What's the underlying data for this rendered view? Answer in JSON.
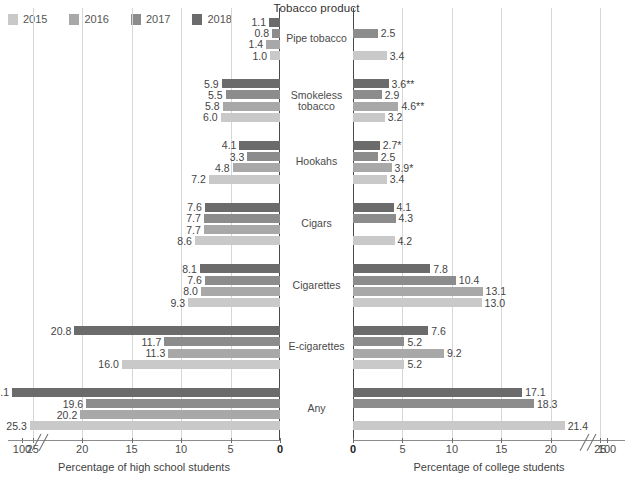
{
  "chart_title": "Tobacco product",
  "legend": {
    "items": [
      {
        "label": "2015",
        "color": "#c9c9c9"
      },
      {
        "label": "2016",
        "color": "#a8a8a8"
      },
      {
        "label": "2017",
        "color": "#8c8c8c"
      },
      {
        "label": "2018",
        "color": "#6b6b6b"
      }
    ]
  },
  "axes": {
    "left": {
      "caption": "Percentage of high school students",
      "ticks": [
        "100",
        "25",
        "20",
        "15",
        "10",
        "5",
        "0"
      ],
      "break_after": "100"
    },
    "right": {
      "caption": "Percentage of college students",
      "ticks": [
        "0",
        "5",
        "10",
        "15",
        "20",
        "25",
        "100"
      ],
      "break_before": "100"
    }
  },
  "chart_data": {
    "type": "bar",
    "orientation": "horizontal-pyramid",
    "title": "Tobacco product",
    "categories": [
      "Pipe tobacco",
      "Smokeless tobacco",
      "Hookahs",
      "Cigars",
      "Cigarettes",
      "E-cigarettes",
      "Any"
    ],
    "xlabel_left": "Percentage of high school students",
    "xlabel_right": "Percentage of college students",
    "xlim": [
      0,
      27.5
    ],
    "grid": true,
    "legend_position": "top-left",
    "series": [
      {
        "name": "2018",
        "color": "#6b6b6b"
      },
      {
        "name": "2017",
        "color": "#8c8c8c"
      },
      {
        "name": "2016",
        "color": "#a8a8a8"
      },
      {
        "name": "2015",
        "color": "#c9c9c9"
      }
    ],
    "panels": [
      {
        "name": "high school students",
        "side": "left",
        "groups": [
          {
            "category": "Pipe tobacco",
            "bars": [
              {
                "year": "2018",
                "value": 1.1,
                "label": "1.1"
              },
              {
                "year": "2017",
                "value": 0.8,
                "label": "0.8"
              },
              {
                "year": "2016",
                "value": 1.4,
                "label": "1.4"
              },
              {
                "year": "2015",
                "value": 1.0,
                "label": "1.0"
              }
            ]
          },
          {
            "category": "Smokeless tobacco",
            "bars": [
              {
                "year": "2018",
                "value": 5.9,
                "label": "5.9"
              },
              {
                "year": "2017",
                "value": 5.5,
                "label": "5.5"
              },
              {
                "year": "2016",
                "value": 5.8,
                "label": "5.8"
              },
              {
                "year": "2015",
                "value": 6.0,
                "label": "6.0"
              }
            ]
          },
          {
            "category": "Hookahs",
            "bars": [
              {
                "year": "2018",
                "value": 4.1,
                "label": "4.1"
              },
              {
                "year": "2017",
                "value": 3.3,
                "label": "3.3"
              },
              {
                "year": "2016",
                "value": 4.8,
                "label": "4.8"
              },
              {
                "year": "2015",
                "value": 7.2,
                "label": "7.2"
              }
            ]
          },
          {
            "category": "Cigars",
            "bars": [
              {
                "year": "2018",
                "value": 7.6,
                "label": "7.6"
              },
              {
                "year": "2017",
                "value": 7.7,
                "label": "7.7"
              },
              {
                "year": "2016",
                "value": 7.7,
                "label": "7.7"
              },
              {
                "year": "2015",
                "value": 8.6,
                "label": "8.6"
              }
            ]
          },
          {
            "category": "Cigarettes",
            "bars": [
              {
                "year": "2018",
                "value": 8.1,
                "label": "8.1"
              },
              {
                "year": "2017",
                "value": 7.6,
                "label": "7.6"
              },
              {
                "year": "2016",
                "value": 8.0,
                "label": "8.0"
              },
              {
                "year": "2015",
                "value": 9.3,
                "label": "9.3"
              }
            ]
          },
          {
            "category": "E-cigarettes",
            "bars": [
              {
                "year": "2018",
                "value": 20.8,
                "label": "20.8"
              },
              {
                "year": "2017",
                "value": 11.7,
                "label": "11.7"
              },
              {
                "year": "2016",
                "value": 11.3,
                "label": "11.3"
              },
              {
                "year": "2015",
                "value": 16.0,
                "label": "16.0"
              }
            ]
          },
          {
            "category": "Any",
            "bars": [
              {
                "year": "2018",
                "value": 27.1,
                "label": "27.1"
              },
              {
                "year": "2017",
                "value": 19.6,
                "label": "19.6"
              },
              {
                "year": "2016",
                "value": 20.2,
                "label": "20.2"
              },
              {
                "year": "2015",
                "value": 25.3,
                "label": "25.3"
              }
            ]
          }
        ]
      },
      {
        "name": "college students",
        "side": "right",
        "groups": [
          {
            "category": "Pipe tobacco",
            "bars": [
              {
                "year": "2017",
                "value": 2.5,
                "label": "2.5"
              },
              {
                "year": "2015",
                "value": 3.4,
                "label": "3.4"
              }
            ]
          },
          {
            "category": "Smokeless tobacco",
            "bars": [
              {
                "year": "2018",
                "value": 3.6,
                "label": "3.6**"
              },
              {
                "year": "2017",
                "value": 2.9,
                "label": "2.9"
              },
              {
                "year": "2016",
                "value": 4.6,
                "label": "4.6**"
              },
              {
                "year": "2015",
                "value": 3.2,
                "label": "3.2"
              }
            ]
          },
          {
            "category": "Hookahs",
            "bars": [
              {
                "year": "2018",
                "value": 2.7,
                "label": "2.7*"
              },
              {
                "year": "2017",
                "value": 2.5,
                "label": "2.5"
              },
              {
                "year": "2016",
                "value": 3.9,
                "label": "3.9*"
              },
              {
                "year": "2015",
                "value": 3.4,
                "label": "3.4"
              }
            ]
          },
          {
            "category": "Cigars",
            "bars": [
              {
                "year": "2018",
                "value": 4.1,
                "label": "4.1"
              },
              {
                "year": "2017",
                "value": 4.3,
                "label": "4.3"
              },
              {
                "year": "2015",
                "value": 4.2,
                "label": "4.2"
              }
            ]
          },
          {
            "category": "Cigarettes",
            "bars": [
              {
                "year": "2018",
                "value": 7.8,
                "label": "7.8"
              },
              {
                "year": "2017",
                "value": 10.4,
                "label": "10.4"
              },
              {
                "year": "2016",
                "value": 13.1,
                "label": "13.1"
              },
              {
                "year": "2015",
                "value": 13.0,
                "label": "13.0"
              }
            ]
          },
          {
            "category": "E-cigarettes",
            "bars": [
              {
                "year": "2018",
                "value": 7.6,
                "label": "7.6"
              },
              {
                "year": "2017",
                "value": 5.2,
                "label": "5.2"
              },
              {
                "year": "2016",
                "value": 9.2,
                "label": "9.2"
              },
              {
                "year": "2015",
                "value": 5.2,
                "label": "5.2"
              }
            ]
          },
          {
            "category": "Any",
            "bars": [
              {
                "year": "2018",
                "value": 17.1,
                "label": "17.1"
              },
              {
                "year": "2017",
                "value": 18.3,
                "label": "18.3"
              },
              {
                "year": "2015",
                "value": 21.4,
                "label": "21.4"
              }
            ]
          }
        ]
      }
    ]
  }
}
